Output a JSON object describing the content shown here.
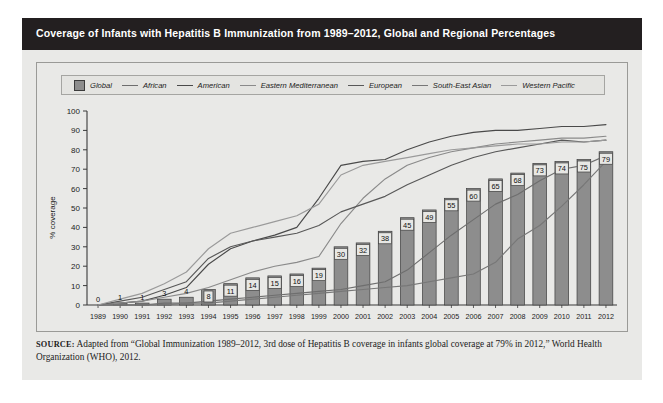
{
  "header": {
    "title": "Coverage of Infants with Hepatitis B Immunization from 1989–2012, Global and Regional Percentages"
  },
  "axes": {
    "ylabel": "% coverage",
    "yticks": [
      "0",
      "10",
      "20",
      "30",
      "40",
      "50",
      "60",
      "70",
      "80",
      "90",
      "100"
    ],
    "ylim": [
      0,
      100
    ]
  },
  "source": {
    "prefix": "SOURCE:",
    "text": " Adapted from “Global Immunization 1989–2012, 3rd dose of Hepatitis B coverage in infants global coverage at 79% in 2012,” World Health Organization (WHO), 2012."
  },
  "legend": {
    "items": [
      {
        "label": "Global",
        "type": "swatch",
        "color": "#8d8d8d"
      },
      {
        "label": "African",
        "type": "line",
        "color": "#6e6e6e"
      },
      {
        "label": "American",
        "type": "line",
        "color": "#4a4a4a"
      },
      {
        "label": "Eastern Mediterranean",
        "type": "line",
        "color": "#8a8a8a"
      },
      {
        "label": "European",
        "type": "line",
        "color": "#585858"
      },
      {
        "label": "South-East Asian",
        "type": "line",
        "color": "#777777"
      },
      {
        "label": "Western Pacific",
        "type": "line",
        "color": "#9a9a9a"
      }
    ]
  },
  "chart_data": {
    "type": "bar",
    "title": "Coverage of Infants with Hepatitis B Immunization from 1989–2012, Global and Regional Percentages",
    "xlabel": "",
    "ylabel": "% coverage",
    "ylim": [
      0,
      100
    ],
    "grid": false,
    "legend_position": "top",
    "categories": [
      "1989",
      "1990",
      "1991",
      "1992",
      "1993",
      "1994",
      "1995",
      "1996",
      "1997",
      "1998",
      "1999",
      "2000",
      "2001",
      "2002",
      "2003",
      "2004",
      "2005",
      "2006",
      "2007",
      "2008",
      "2009",
      "2010",
      "2011",
      "2012"
    ],
    "values": [
      0,
      1,
      1,
      3,
      4,
      8,
      11,
      14,
      15,
      16,
      19,
      30,
      32,
      38,
      45,
      49,
      55,
      60,
      65,
      68,
      73,
      74,
      75,
      79
    ],
    "series": [
      {
        "name": "Global",
        "type": "bar",
        "color": "#8d8d8d",
        "values": [
          0,
          1,
          1,
          3,
          4,
          8,
          11,
          14,
          15,
          16,
          19,
          30,
          32,
          38,
          45,
          49,
          55,
          60,
          65,
          68,
          73,
          74,
          75,
          79
        ]
      },
      {
        "name": "African",
        "type": "line",
        "color": "#6e6e6e",
        "values": [
          0,
          0,
          0,
          1,
          1,
          2,
          3,
          4,
          5,
          6,
          7,
          8,
          10,
          12,
          18,
          27,
          36,
          44,
          52,
          57,
          64,
          70,
          72,
          77
        ]
      },
      {
        "name": "American",
        "type": "line",
        "color": "#4a4a4a",
        "values": [
          0,
          1,
          2,
          5,
          9,
          21,
          29,
          33,
          36,
          40,
          55,
          72,
          74,
          75,
          80,
          84,
          87,
          89,
          90,
          90,
          91,
          92,
          92,
          93
        ]
      },
      {
        "name": "Eastern Mediterranean",
        "type": "line",
        "color": "#8a8a8a",
        "values": [
          0,
          1,
          2,
          4,
          6,
          9,
          13,
          17,
          20,
          22,
          25,
          42,
          55,
          65,
          72,
          76,
          79,
          81,
          83,
          84,
          85,
          86,
          86,
          87
        ]
      },
      {
        "name": "European",
        "type": "line",
        "color": "#585858",
        "values": [
          0,
          2,
          4,
          8,
          12,
          24,
          30,
          33,
          35,
          37,
          41,
          48,
          52,
          56,
          62,
          67,
          72,
          76,
          79,
          81,
          83,
          85,
          84,
          85
        ]
      },
      {
        "name": "South-East Asian",
        "type": "line",
        "color": "#777777",
        "values": [
          0,
          0,
          0,
          0,
          1,
          1,
          2,
          3,
          4,
          5,
          6,
          7,
          8,
          9,
          10,
          12,
          14,
          16,
          22,
          34,
          41,
          51,
          62,
          74
        ]
      },
      {
        "name": "Western Pacific",
        "type": "line",
        "color": "#9a9a9a",
        "values": [
          0,
          3,
          6,
          11,
          17,
          29,
          37,
          40,
          43,
          46,
          52,
          67,
          72,
          74,
          76,
          78,
          80,
          81,
          82,
          83,
          83,
          84,
          84,
          85
        ]
      }
    ]
  }
}
